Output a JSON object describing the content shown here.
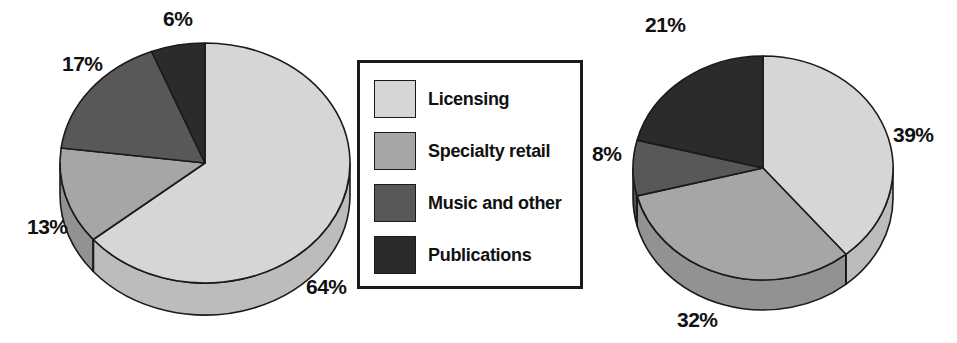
{
  "legend": {
    "items": [
      {
        "label": "Licensing",
        "color": "#d6d6d6",
        "swatch_name": "legend-swatch-licensing"
      },
      {
        "label": "Specialty retail",
        "color": "#a6a6a6",
        "swatch_name": "legend-swatch-specialty-retail"
      },
      {
        "label": "Music and other",
        "color": "#585858",
        "swatch_name": "legend-swatch-music-and-other"
      },
      {
        "label": "Publications",
        "color": "#2b2b2b",
        "swatch_name": "legend-swatch-publications"
      }
    ]
  },
  "labels": {
    "left": {
      "licensing": "64%",
      "specialty": "13%",
      "music": "17%",
      "publications": "6%"
    },
    "right": {
      "licensing": "39%",
      "specialty": "32%",
      "music": "8%",
      "publications": "21%"
    }
  },
  "chart_data": [
    {
      "type": "pie",
      "title": "",
      "name": "left-pie-chart",
      "labels": [
        "Licensing",
        "Specialty retail",
        "Music and other",
        "Publications"
      ],
      "values": [
        64,
        13,
        17,
        6
      ],
      "value_labels": [
        "64%",
        "13%",
        "17%",
        "6%"
      ],
      "colors": [
        "#d6d6d6",
        "#a6a6a6",
        "#585858",
        "#2b2b2b"
      ],
      "legend_position": "center",
      "three_d": true,
      "start_angle_deg": 0,
      "direction": "clockwise"
    },
    {
      "type": "pie",
      "title": "",
      "name": "right-pie-chart",
      "labels": [
        "Licensing",
        "Specialty retail",
        "Music and other",
        "Publications"
      ],
      "values": [
        39,
        32,
        8,
        21
      ],
      "value_labels": [
        "39%",
        "32%",
        "8%",
        "21%"
      ],
      "colors": [
        "#d6d6d6",
        "#a6a6a6",
        "#585858",
        "#2b2b2b"
      ],
      "legend_position": "center",
      "three_d": true,
      "start_angle_deg": 0,
      "direction": "clockwise"
    }
  ]
}
